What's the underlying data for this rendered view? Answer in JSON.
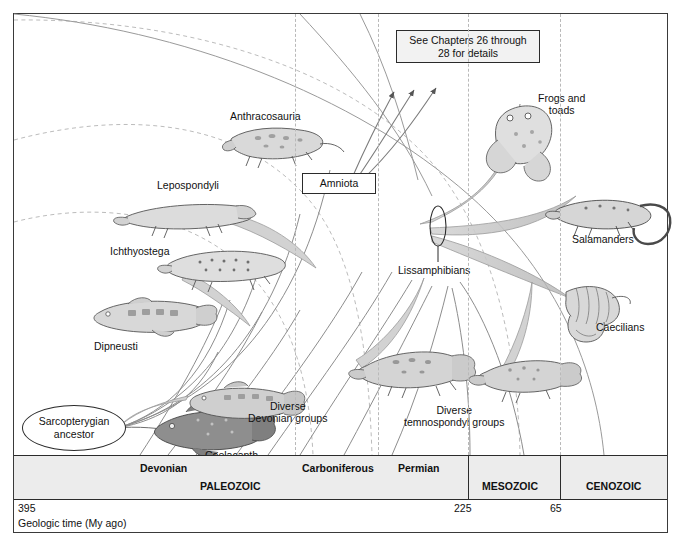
{
  "figure": {
    "title_box": {
      "label": "See Chapters 26 through\n28 for details"
    },
    "amniota_box": {
      "label": "Amniota"
    },
    "ancestor_oval": {
      "label": "Sarcopterygian\nancestor"
    }
  },
  "taxa": [
    {
      "id": "anthracosauria",
      "label": "Anthracosauria"
    },
    {
      "id": "lepospondyli",
      "label": "Lepospondyli"
    },
    {
      "id": "ichthyostega",
      "label": "Ichthyostega"
    },
    {
      "id": "dipneusti",
      "label": "Dipneusti"
    },
    {
      "id": "coelacanth",
      "label": "Coelacanth"
    },
    {
      "id": "frogs-and-toads",
      "label": "Frogs and\ntoads"
    },
    {
      "id": "salamanders",
      "label": "Salamanders"
    },
    {
      "id": "caecilians",
      "label": "Caecilians"
    },
    {
      "id": "lissamphibians",
      "label": "Lissamphibians"
    },
    {
      "id": "diverse-devonian",
      "label": "Diverse\nDevonian groups"
    },
    {
      "id": "diverse-temnospondyl",
      "label": "Diverse\ntemnospondyl groups"
    }
  ],
  "timescale": {
    "eras": [
      {
        "label": "PALEOZOIC"
      },
      {
        "label": "MESOZOIC"
      },
      {
        "label": "CENOZOIC"
      }
    ],
    "periods": [
      {
        "label": "Devonian"
      },
      {
        "label": "Carboniferous"
      },
      {
        "label": "Permian"
      }
    ],
    "ticks": [
      {
        "value": "395"
      },
      {
        "value": "225"
      },
      {
        "value": "65"
      }
    ],
    "axis_caption": "Geologic time (My ago)"
  },
  "colors": {
    "frame": "#3a3a3a",
    "band": "#ececec",
    "line": "#8d8d8d",
    "dash": "#b9b9b9",
    "text": "#111111",
    "fan": "#c9c9c9"
  }
}
